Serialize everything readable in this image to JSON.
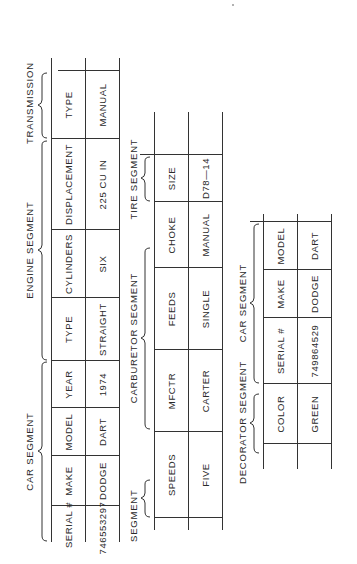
{
  "figure": {
    "orientation": "rotated-90-ccw",
    "segments": {
      "car_segment_main": {
        "label": "CAR SEGMENT",
        "columns": [
          "SERIAL #",
          "MAKE",
          "MODEL",
          "YEAR"
        ],
        "values": [
          "746553297",
          "DODGE",
          "DART",
          "1974"
        ]
      },
      "engine_segment": {
        "label": "ENGINE SEGMENT",
        "columns": [
          "TYPE",
          "CYLINDERS",
          "DISPLACEMENT"
        ],
        "values": [
          "STRAIGHT",
          "SIX",
          "225 CU IN"
        ]
      },
      "transmission_segment": {
        "label": "TRANSMISSION",
        "columns": [
          "TYPE"
        ],
        "values": [
          "MANUAL"
        ]
      },
      "transmission_sub_segment": {
        "label": "SEGMENT",
        "columns": [
          "SPEEDS"
        ],
        "values": [
          "FIVE"
        ]
      },
      "carburetor_segment": {
        "label": "CARBURETOR SEGMENT",
        "columns": [
          "MFCTR",
          "FEEDS",
          "CHOKE"
        ],
        "values": [
          "CARTER",
          "SINGLE",
          "MANUAL"
        ]
      },
      "tire_segment": {
        "label": "TIRE SEGMENT",
        "columns": [
          "SIZE"
        ],
        "values": [
          "D78—14"
        ]
      },
      "decorator_segment": {
        "label": "DECORATOR SEGMENT",
        "columns": [
          "COLOR"
        ],
        "values": [
          "GREEN"
        ]
      },
      "car_segment_secondary": {
        "label": "CAR SEGMENT",
        "columns": [
          "SERIAL #",
          "MAKE",
          "MODEL"
        ],
        "values": [
          "749864529",
          "DODGE",
          "DART"
        ]
      }
    }
  }
}
